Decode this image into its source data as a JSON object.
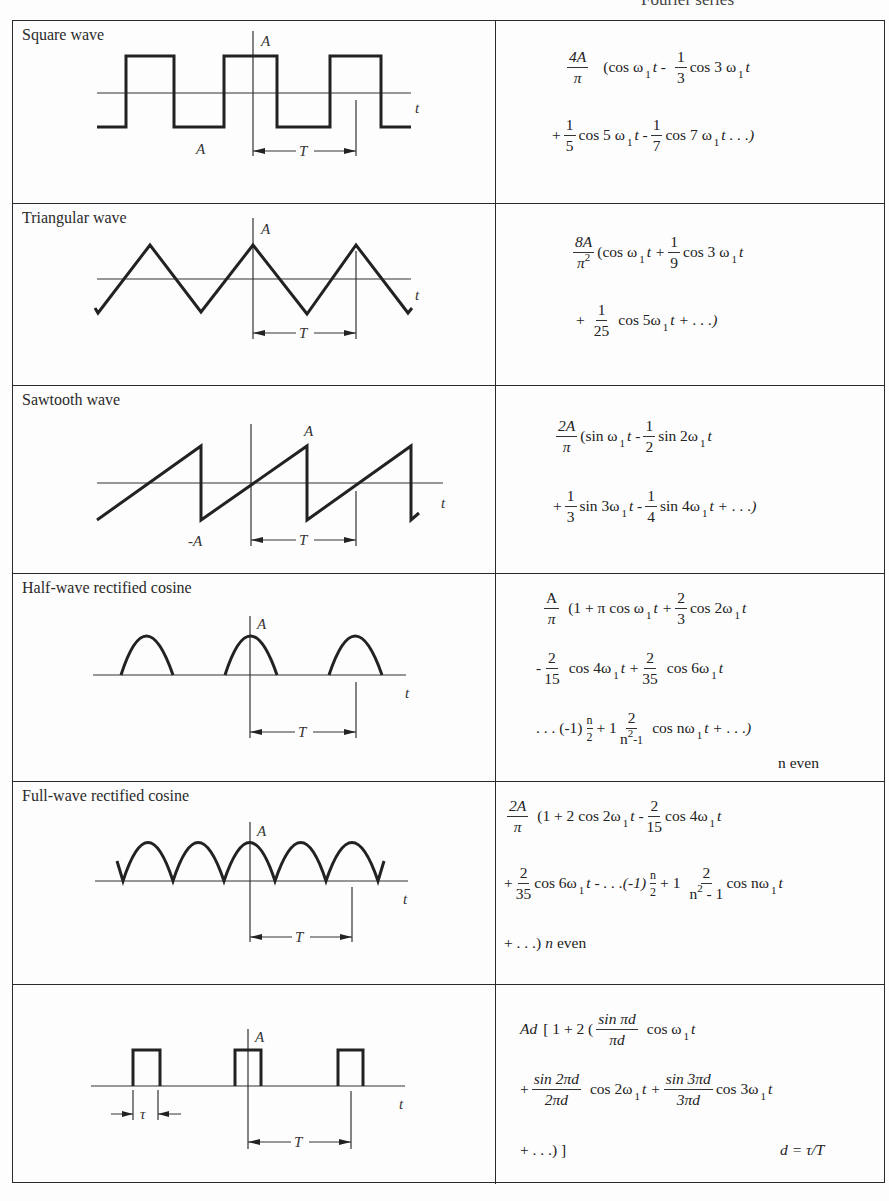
{
  "header": {
    "title": "Fourier series"
  },
  "rows": [
    {
      "title": "Square wave",
      "labels": {
        "amplitude_top": "A",
        "amplitude_bottom": "A",
        "axis": "t",
        "period": "T"
      },
      "formula": {
        "coef_num": "4A",
        "coef_den": "π",
        "line1": [
          "(cos ω",
          "1",
          "t -",
          "1",
          "3",
          "cos 3 ω",
          "1",
          "t"
        ],
        "line2": [
          "+",
          "1",
          "5",
          "cos 5 ω",
          "1",
          "t -",
          "1",
          "7",
          "cos 7 ω",
          "1",
          "t . . .)"
        ]
      }
    },
    {
      "title": "Triangular wave",
      "labels": {
        "amplitude_top": "A",
        "axis": "t",
        "period": "T"
      },
      "formula": {
        "coef_num": "8A",
        "coef_den": "π",
        "coef_den_exp": "2",
        "line1": [
          "(cos ω",
          "1",
          "t +",
          "1",
          "9",
          "cos 3 ω",
          "1",
          "t"
        ],
        "line2": [
          "+",
          "1",
          "25",
          "cos 5ω",
          "1",
          "t + . . .)"
        ]
      }
    },
    {
      "title": "Sawtooth wave",
      "labels": {
        "amplitude_top": "A",
        "amplitude_bottom": "-A",
        "axis": "t",
        "period": "T"
      },
      "formula": {
        "coef_num": "2A",
        "coef_den": "π",
        "line1": [
          "(sin ω",
          "1",
          "t -",
          "1",
          "2",
          "sin 2ω",
          "1",
          "t"
        ],
        "line2": [
          "+",
          "1",
          "3",
          "sin 3ω",
          "1",
          "t -",
          "1",
          "4",
          "sin 4ω",
          "1",
          "t + . . .)"
        ]
      }
    },
    {
      "title": "Half-wave rectified cosine",
      "labels": {
        "amplitude_top": "A",
        "axis": "t",
        "period": "T"
      },
      "formula": {
        "coef_num": "A",
        "coef_den": "π",
        "line1": [
          "(1 + π cos ω",
          "1",
          "t +",
          "2",
          "3",
          "cos 2ω",
          "1",
          "t"
        ],
        "line2": [
          "-",
          "2",
          "15",
          "cos 4ω",
          "1",
          "t +",
          "2",
          "35",
          "cos 6ω",
          "1",
          "t"
        ],
        "line3": [
          ". . . (-1)",
          "n",
          "2",
          "+ 1",
          "2",
          "n",
          "2",
          "-1",
          "cos nω",
          "1",
          "t + . . .)"
        ],
        "note": "n even"
      }
    },
    {
      "title": "Full-wave rectified cosine",
      "labels": {
        "amplitude_top": "A",
        "axis": "t",
        "period": "T"
      },
      "formula": {
        "coef_num": "2A",
        "coef_den": "π",
        "line1": [
          "(1 + 2 cos 2ω",
          "1",
          "t -",
          "2",
          "15",
          "cos 4ω",
          "1",
          "t"
        ],
        "line2": [
          "+",
          "2",
          "35",
          "cos 6ω",
          "1",
          "t - . . .(-1)",
          "n",
          "2",
          "+ 1",
          "2",
          "n",
          "2",
          "- 1",
          "cos nω",
          "1",
          "t"
        ],
        "line3": [
          "+ . . .)",
          "n",
          "even"
        ]
      }
    },
    {
      "title": "",
      "labels": {
        "amplitude_top": "A",
        "axis": "t",
        "period": "T",
        "width": "τ"
      },
      "formula": {
        "line1": [
          "Ad",
          "[ 1 + 2 (",
          "sin πd",
          "πd",
          "cos ω",
          "1",
          "t"
        ],
        "line2": [
          "+",
          "sin 2πd",
          "2πd",
          "cos 2ω",
          "1",
          "t +",
          "sin 3πd",
          "3πd",
          "cos 3ω",
          "1",
          "t"
        ],
        "line3": [
          "+ . . .) ]"
        ],
        "note": "d = τ/T"
      }
    }
  ]
}
